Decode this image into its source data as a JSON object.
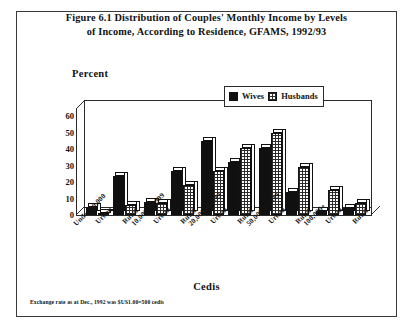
{
  "figure": {
    "title_line1": "Figure 6.1  Distribution of Couples' Monthly Income by Levels",
    "title_line2": "of Income, According to Residence, GFAMS, 1992/93",
    "footnote": "Exchange rate as at Dec., 1992 was $US1.00=500 cedis"
  },
  "legend": {
    "items": [
      {
        "label": "Wives",
        "pattern": "solid-black",
        "color": "#101010"
      },
      {
        "label": "Husbands",
        "pattern": "cross-hatch",
        "color": "#2b2b2b"
      }
    ]
  },
  "chart_data": {
    "type": "bar",
    "title": "Figure 6.1  Distribution of Couples' Monthly Income by Levels of Income, According to Residence, GFAMS, 1992/93",
    "xlabel": "Cedis",
    "ylabel": "Percent",
    "ylim": [
      0,
      65
    ],
    "yticks": [
      0,
      10,
      20,
      30,
      40,
      50,
      60
    ],
    "grid": false,
    "legend_position": "top-right",
    "style": "3d-grouped-bars",
    "groups": [
      {
        "income_range": "Under 10,000",
        "residences": [
          {
            "residence": "Urban",
            "wives": 5,
            "husbands": 1.5
          },
          {
            "residence": "Rural",
            "wives": 24,
            "husbands": 6
          }
        ]
      },
      {
        "income_range": "10,000-19,999",
        "residences": [
          {
            "residence": "Urban",
            "wives": 8,
            "husbands": 7
          },
          {
            "residence": "Rural",
            "wives": 27,
            "husbands": 18
          }
        ]
      },
      {
        "income_range": "20,000-49,999",
        "residences": [
          {
            "residence": "Urban",
            "wives": 45,
            "husbands": 27
          },
          {
            "residence": "Rural",
            "wives": 32,
            "husbands": 41
          }
        ]
      },
      {
        "income_range": "50,000-99,999",
        "residences": [
          {
            "residence": "Urban",
            "wives": 41,
            "husbands": 50
          },
          {
            "residence": "Rural",
            "wives": 14,
            "husbands": 29
          }
        ]
      },
      {
        "income_range": "100,000+",
        "residences": [
          {
            "residence": "Urban",
            "wives": 2.5,
            "husbands": 15
          },
          {
            "residence": "Rural",
            "wives": 4,
            "husbands": 7
          }
        ]
      }
    ],
    "categories": [
      "Under 10,000 Urban",
      "Under 10,000 Rural",
      "10,000-19,999 Urban",
      "10,000-19,999 Rural",
      "20,000-49,999 Urban",
      "20,000-49,999 Rural",
      "50,000-99,999 Urban",
      "50,000-99,999 Rural",
      "100,000+ Urban",
      "100,000+ Rural"
    ],
    "series": [
      {
        "name": "Wives",
        "values": [
          5,
          24,
          8,
          27,
          45,
          32,
          41,
          14,
          2.5,
          4
        ]
      },
      {
        "name": "Husbands",
        "values": [
          1.5,
          6,
          7,
          18,
          27,
          41,
          50,
          29,
          15,
          7
        ]
      }
    ]
  }
}
